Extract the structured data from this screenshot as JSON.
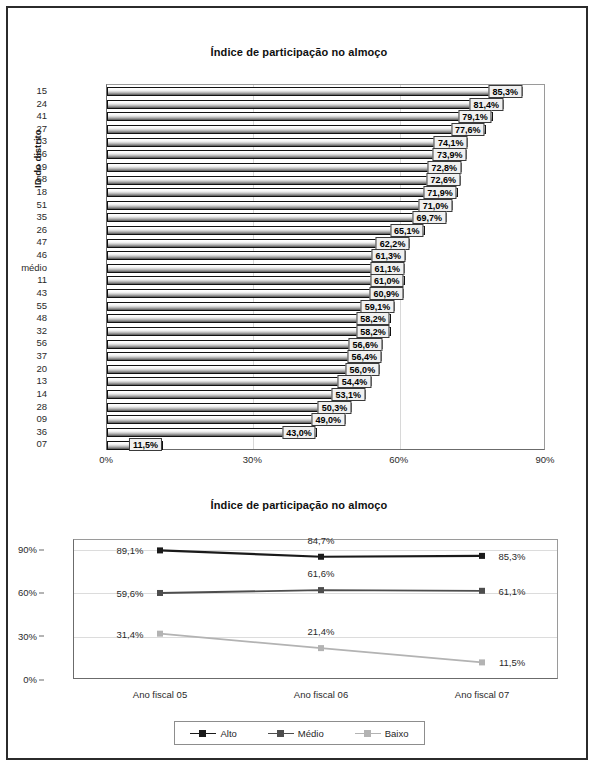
{
  "bar_chart": {
    "title": "Índice de participação no almoço",
    "ylabel": "ID do distrito",
    "xticks": [
      "0%",
      "30%",
      "60%",
      "90%"
    ]
  },
  "line_chart": {
    "title": "Índice de participação no almoço",
    "yticks": [
      "90%",
      "60%",
      "30%",
      "0%"
    ],
    "xticks": [
      "Ano fiscal 05",
      "Ano fiscal 06",
      "Ano fiscal 07"
    ],
    "legend": [
      "Alto",
      "Médio",
      "Baixo"
    ]
  },
  "chart_data": [
    {
      "type": "bar",
      "title": "Índice de participação no almoço",
      "xlabel": "",
      "ylabel": "ID do distrito",
      "orientation": "horizontal",
      "xlim": [
        0,
        90
      ],
      "xticks": [
        0,
        30,
        60,
        90
      ],
      "grid": true,
      "categories": [
        "15",
        "24",
        "41",
        "27",
        "03",
        "66",
        "19",
        "58",
        "18",
        "51",
        "35",
        "26",
        "47",
        "46",
        "médio",
        "11",
        "43",
        "55",
        "48",
        "32",
        "56",
        "37",
        "20",
        "13",
        "14",
        "28",
        "09",
        "36",
        "07"
      ],
      "values": [
        85.3,
        81.4,
        79.1,
        77.6,
        74.1,
        73.9,
        72.8,
        72.6,
        71.9,
        71.0,
        69.7,
        65.1,
        62.2,
        61.3,
        61.1,
        61.0,
        60.9,
        59.1,
        58.2,
        58.2,
        56.6,
        56.4,
        56.0,
        54.4,
        53.1,
        50.3,
        49.0,
        43.0,
        11.5
      ],
      "data_labels": [
        "85,3%",
        "81,4%",
        "79,1%",
        "77,6%",
        "74,1%",
        "73,9%",
        "72,8%",
        "72,6%",
        "71,9%",
        "71,0%",
        "69,7%",
        "65,1%",
        "62,2%",
        "61,3%",
        "61,1%",
        "61,0%",
        "60,9%",
        "59,1%",
        "58,2%",
        "58,2%",
        "56,6%",
        "56,4%",
        "56,0%",
        "54,4%",
        "53,1%",
        "50,3%",
        "49,0%",
        "43,0%",
        "11,5%"
      ]
    },
    {
      "type": "line",
      "title": "Índice de participação no almoço",
      "xlabel": "",
      "ylabel": "",
      "ylim": [
        0,
        97
      ],
      "yticks": [
        0,
        30,
        60,
        90
      ],
      "ytick_labels": [
        "0%",
        "30%",
        "60%",
        "90%"
      ],
      "grid": true,
      "legend_position": "bottom",
      "x": [
        "Ano fiscal 05",
        "Ano fiscal 06",
        "Ano fiscal 07"
      ],
      "series": [
        {
          "name": "Alto",
          "values": [
            89.1,
            84.7,
            85.3
          ],
          "labels": [
            "89,1%",
            "84,7%",
            "85,3%"
          ],
          "color": "#1a1a1a"
        },
        {
          "name": "Médio",
          "values": [
            59.6,
            61.6,
            61.1
          ],
          "labels": [
            "59,6%",
            "61,6%",
            "61,1%"
          ],
          "color": "#4d4d4d"
        },
        {
          "name": "Baixo",
          "values": [
            31.4,
            21.4,
            11.5
          ],
          "labels": [
            "31,4%",
            "21,4%",
            "11,5%"
          ],
          "color": "#b3b3b3"
        }
      ]
    }
  ]
}
